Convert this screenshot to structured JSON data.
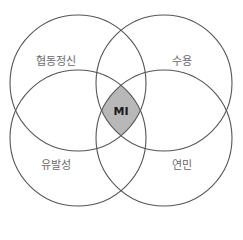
{
  "diagram": {
    "type": "venn-4",
    "sets": [
      {
        "label": "협동정신",
        "position": "top-left"
      },
      {
        "label": "수용",
        "position": "top-right"
      },
      {
        "label": "유발성",
        "position": "bottom-left"
      },
      {
        "label": "연민",
        "position": "bottom-right"
      }
    ],
    "intersection": {
      "label": "MI",
      "fill": "#b8b8b8"
    },
    "colors": {
      "stroke": "#555555",
      "label": "#6a6a6a",
      "background": "#ffffff"
    }
  }
}
